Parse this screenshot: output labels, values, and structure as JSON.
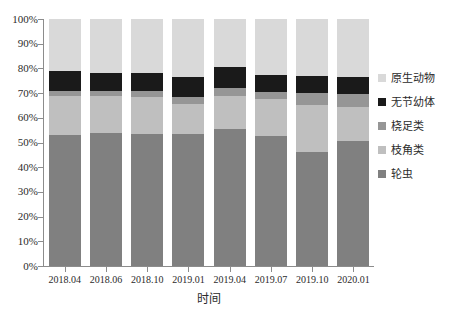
{
  "chart_data": {
    "type": "bar",
    "stacked": true,
    "normalized": true,
    "title": "",
    "xlabel": "时间",
    "ylabel": "",
    "ylim": [
      0,
      100
    ],
    "grid": false,
    "legend_position": "right",
    "categories": [
      "2018.04",
      "2018.06",
      "2018.10",
      "2019.01",
      "2019.04",
      "2019.07",
      "2019.10",
      "2020.01"
    ],
    "y_tick_labels": [
      "0%",
      "10%",
      "20%",
      "30%",
      "40%",
      "50%",
      "60%",
      "70%",
      "80%",
      "90%",
      "100%"
    ],
    "y_tick_values": [
      0,
      10,
      20,
      30,
      40,
      50,
      60,
      70,
      80,
      90,
      100
    ],
    "series": [
      {
        "name": "轮虫",
        "color": "#808080",
        "values": [
          53.0,
          54.0,
          53.5,
          53.5,
          55.5,
          52.5,
          46.0,
          50.5
        ]
      },
      {
        "name": "枝角类",
        "color": "#BFBFBF",
        "values": [
          16.0,
          15.0,
          15.0,
          12.0,
          13.5,
          15.0,
          19.0,
          14.0
        ]
      },
      {
        "name": "桡足类",
        "color": "#969696",
        "values": [
          2.0,
          2.0,
          2.5,
          3.0,
          3.0,
          3.0,
          5.0,
          5.0
        ]
      },
      {
        "name": "无节幼体",
        "color": "#1A1A1A",
        "values": [
          8.0,
          7.0,
          7.0,
          8.0,
          8.5,
          7.0,
          7.0,
          7.0
        ]
      },
      {
        "name": "原生动物",
        "color": "#D9D9D9",
        "values": [
          21.0,
          22.0,
          22.0,
          23.5,
          19.5,
          22.5,
          23.0,
          23.5
        ]
      }
    ],
    "legend_order": [
      "原生动物",
      "无节幼体",
      "桡足类",
      "枝角类",
      "轮虫"
    ]
  }
}
